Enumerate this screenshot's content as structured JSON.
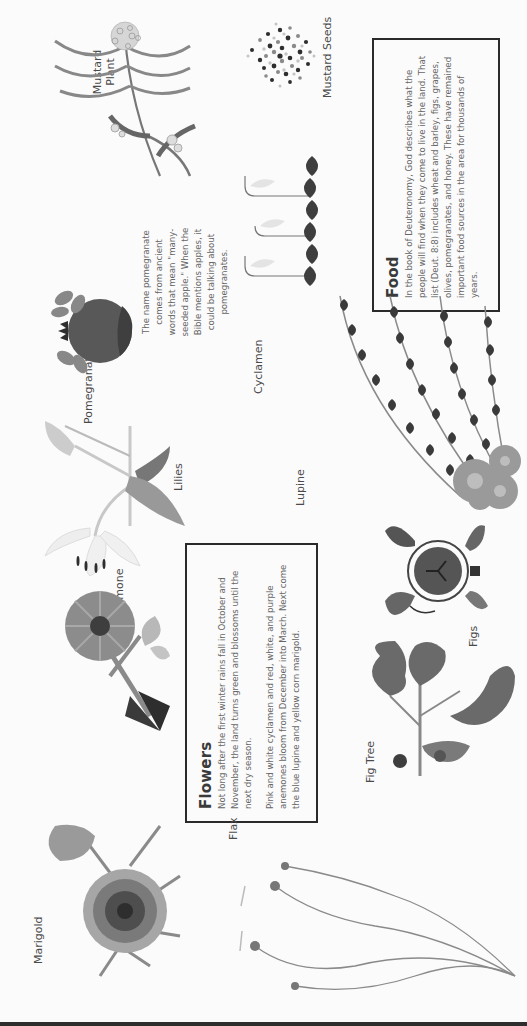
{
  "page": {
    "orientation": "rotated-90-ccw",
    "header_edge_text": "……………………………………………………"
  },
  "sections": {
    "food": {
      "title": "Food",
      "paragraphs": [
        "In the book of Deuteronomy, God describes what the people will find when they come to live in the land. That list (Deut. 8:8) includes wheat and barley, figs, grapes, olives, pomegranates, and honey. These have remained important food sources in the area for thousands of years."
      ]
    },
    "flowers": {
      "title": "Flowers",
      "paragraphs": [
        "Not long after the first winter rains fall in October and November, the land turns green and blossoms until the next dry season.",
        "Pink and white cyclamen and red, white, and purple anemones bloom from December into March. Next come the blue lupine and yellow corn marigold."
      ]
    }
  },
  "notes": {
    "pomegranate": "The name pomegranate comes from ancient words that mean \"many-seeded apple.\" When the Bible mentions apples, it could be talking about pomegranates."
  },
  "labels": {
    "mustard_seeds": "Mustard Seeds",
    "mustard_plant_line1": "Mustard",
    "mustard_plant_line2": "Plant",
    "pomegranate": "Pomegranate",
    "cyclamen": "Cyclamen",
    "lilies": "Lilies",
    "lupine": "Lupine",
    "anemone": "Anemone",
    "figs": "Figs",
    "fig_tree": "Fig Tree",
    "flax": "Flax",
    "marigold": "Marigold"
  },
  "colors": {
    "text": "#4a4a4a",
    "body_text": "#666666",
    "box_border": "#2a2a2a",
    "dark_fill": "#3a3a3a",
    "mid_fill": "#7a7a7a",
    "light_fill": "#b5b5b5",
    "paper": "#fbfbfb"
  }
}
